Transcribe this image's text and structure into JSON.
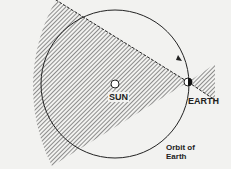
{
  "diagram": {
    "labels": {
      "sun": "SUN",
      "earth": "EARTH",
      "orbit_line1": "Orbit of",
      "orbit_line2": "Earth"
    },
    "colors": {
      "line": "#222222",
      "background": "#f2f2f0",
      "hatch": "#555555"
    }
  }
}
